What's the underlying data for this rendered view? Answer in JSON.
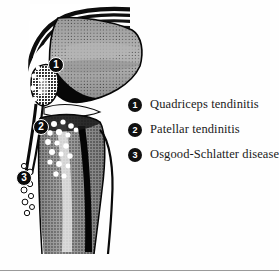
{
  "figure": {
    "background_color": "#fefefe",
    "rule_color": "#9a9a9a"
  },
  "illustration": {
    "name": "knee-lateral-anatomy",
    "view": "lateral",
    "structures": [
      "quadriceps-tendon",
      "femur",
      "patella",
      "patellar-tendon",
      "tibia",
      "tibial-tuberosity",
      "fibula"
    ],
    "marker_badge_color": "#0b0b0b",
    "marker_text_color": "#ffffff",
    "inflammation_dot_color": "#ffffff"
  },
  "markers": [
    {
      "number": "1",
      "label": "Quadriceps tendinitis",
      "x": 48,
      "y": 57
    },
    {
      "number": "2",
      "label": "Patellar tendinitis",
      "x": 33,
      "y": 119
    },
    {
      "number": "3",
      "label": "Osgood-Schlatter disease",
      "x": 16,
      "y": 170
    }
  ],
  "legend": {
    "items": [
      {
        "number": "1",
        "label": "Quadriceps tendinitis"
      },
      {
        "number": "2",
        "label": "Patellar tendinitis"
      },
      {
        "number": "3",
        "label": "Osgood-Schlatter disease"
      }
    ]
  }
}
